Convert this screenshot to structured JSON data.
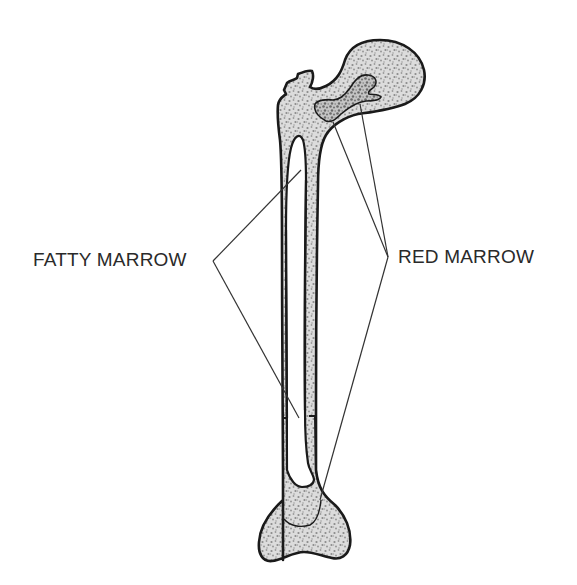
{
  "diagram": {
    "labels": {
      "fatty_marrow": "FATTY MARROW",
      "red_marrow": "RED MARROW"
    },
    "colors": {
      "outline": "#1a1a1a",
      "leader_line": "#333333",
      "stipple_fill": "#d4d4d4",
      "stipple_dot": "#8c8c8c",
      "red_marrow_dot": "#6e6e6e",
      "background": "#ffffff",
      "text": "#2a2a2a"
    },
    "parts": [
      "femoral head",
      "greater trochanter",
      "shaft (diaphysis)",
      "medullary cavity",
      "distal condyles"
    ]
  }
}
